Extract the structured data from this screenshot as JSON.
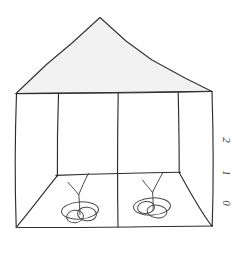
{
  "drawing": {
    "title": "Hand-drawn pavilion structure sketch",
    "subject": "pavilion-with-hanging-lights",
    "background_color": "#ffffff",
    "ink_color": "#2e2e30",
    "roof_fill_color": "#f2f2f2",
    "roof_stroke_color": "#3a3a3c"
  },
  "axis": {
    "name": "vertical-scale",
    "orientation": "vertical",
    "position": "right-edge",
    "rotation_degrees": 90,
    "ticks": [
      {
        "label": "2",
        "y": 140
      },
      {
        "label": "1",
        "y": 173
      },
      {
        "label": "0",
        "y": 203
      }
    ]
  },
  "structure": {
    "roof": {
      "name": "roof-triangle",
      "apex": {
        "x": 100,
        "y": 17
      },
      "left_eave": {
        "x": 16,
        "y": 93
      },
      "right_eave": {
        "x": 212,
        "y": 91
      }
    },
    "posts": [
      {
        "name": "post-far-left",
        "x": 16,
        "y_top": 93,
        "y_bottom": 227
      },
      {
        "name": "post-left",
        "x": 58,
        "y_top": 94,
        "y_bottom": 175
      },
      {
        "name": "post-center",
        "x": 118,
        "y_top": 93,
        "y_bottom": 227
      },
      {
        "name": "post-right",
        "x": 178,
        "y_top": 93,
        "y_bottom": 173
      },
      {
        "name": "post-far-right",
        "x": 212,
        "y_top": 91,
        "y_bottom": 227
      }
    ],
    "back_beam": {
      "name": "back-wall-beam",
      "x1": 56,
      "y1": 175,
      "x2": 180,
      "y2": 172
    },
    "floor_line": {
      "name": "floor-front-edge",
      "x1": 16,
      "y1": 227,
      "x2": 212,
      "y2": 226
    },
    "floor_diagonals": [
      {
        "name": "floor-diagonal-left",
        "x1": 16,
        "y1": 227,
        "x2": 57,
        "y2": 176
      },
      {
        "name": "floor-diagonal-right",
        "x1": 212,
        "y1": 226,
        "x2": 179,
        "y2": 173
      }
    ]
  },
  "fixtures": [
    {
      "name": "hanging-light-left",
      "anchor": {
        "x": 88,
        "y": 173
      },
      "stem_left": {
        "x": 68,
        "y": 183
      },
      "stem_join": {
        "x": 78,
        "y": 194
      },
      "drop_end": {
        "x": 80,
        "y": 212
      },
      "shade_cx": 80,
      "shade_cy": 212,
      "shade_rx": 19,
      "shade_ry": 9
    },
    {
      "name": "hanging-light-right",
      "anchor": {
        "x": 163,
        "y": 172
      },
      "stem_left": {
        "x": 143,
        "y": 180
      },
      "stem_join": {
        "x": 152,
        "y": 192
      },
      "drop_end": {
        "x": 152,
        "y": 208
      },
      "shade_cx": 152,
      "shade_cy": 208,
      "shade_rx": 19,
      "shade_ry": 9
    }
  ]
}
